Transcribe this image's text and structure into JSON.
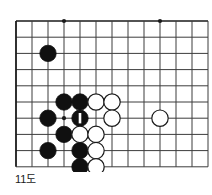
{
  "figure": {
    "caption": "11도",
    "kind": "go-board-diagram"
  },
  "board": {
    "geometry": {
      "origin_x": 16,
      "origin_y": 21,
      "spacing_x": 16,
      "spacing_y": 16.2,
      "cols": 13,
      "rows": 10,
      "left_edge_is_board_border": true,
      "top_edge_is_board_border": true,
      "stone_radius": 8.2
    },
    "colors": {
      "line": "#3c3c3c",
      "border": "#1a1a1a",
      "black_stone": "#101010",
      "white_stone_fill": "#ffffff",
      "white_stone_edge": "#1a1a1a",
      "marker": "#ffffff",
      "background": "#ffffff"
    },
    "star_points": [
      {
        "col": 3,
        "row": 0
      },
      {
        "col": 9,
        "row": 0
      },
      {
        "col": 3,
        "row": 6
      }
    ],
    "stones": [
      {
        "color": "black",
        "col": 2,
        "row": 2,
        "label": ""
      },
      {
        "color": "black",
        "col": 3,
        "row": 5,
        "label": ""
      },
      {
        "color": "black",
        "col": 4,
        "row": 5,
        "label": ""
      },
      {
        "color": "black",
        "col": 2,
        "row": 6,
        "label": ""
      },
      {
        "color": "black",
        "col": 4,
        "row": 6,
        "label": "1",
        "is_move": true
      },
      {
        "color": "black",
        "col": 3,
        "row": 7,
        "label": ""
      },
      {
        "color": "black",
        "col": 2,
        "row": 8,
        "label": ""
      },
      {
        "color": "black",
        "col": 4,
        "row": 8,
        "label": ""
      },
      {
        "color": "black",
        "col": 4,
        "row": 9,
        "label": ""
      },
      {
        "color": "white",
        "col": 5,
        "row": 5,
        "label": ""
      },
      {
        "color": "white",
        "col": 6,
        "row": 5,
        "label": ""
      },
      {
        "color": "white",
        "col": 6,
        "row": 6,
        "label": ""
      },
      {
        "color": "white",
        "col": 9,
        "row": 6,
        "label": ""
      },
      {
        "color": "white",
        "col": 4,
        "row": 7,
        "label": ""
      },
      {
        "color": "white",
        "col": 5,
        "row": 7,
        "label": ""
      },
      {
        "color": "white",
        "col": 5,
        "row": 8,
        "label": ""
      },
      {
        "color": "white",
        "col": 5,
        "row": 9,
        "label": ""
      }
    ],
    "move_marker": {
      "shape": "vertical-bar",
      "number": "1",
      "on_stone": {
        "col": 4,
        "row": 6
      }
    }
  }
}
